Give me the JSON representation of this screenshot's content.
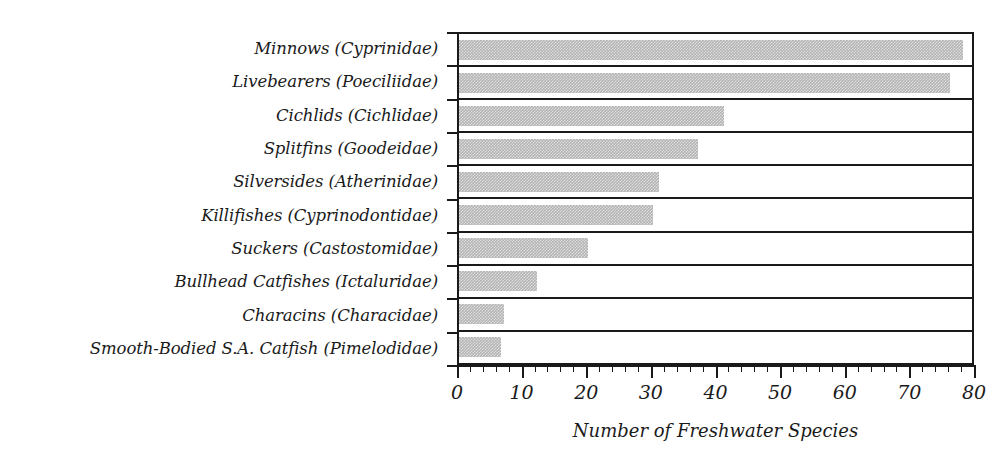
{
  "chart_data": {
    "type": "bar",
    "orientation": "horizontal",
    "title": "",
    "xlabel": "Number of Freshwater Species",
    "ylabel": "",
    "xlim": [
      0,
      80
    ],
    "ylim": null,
    "grid": false,
    "legend": null,
    "bar_color": "#b3b3b3",
    "axis_color": "#1a1a1a",
    "xticks": [
      0,
      10,
      20,
      30,
      40,
      50,
      60,
      70,
      80
    ],
    "xtick_labels": [
      "0",
      "10",
      "20",
      "30",
      "40",
      "50",
      "60",
      "70",
      "80"
    ],
    "minor_tick_step": 2,
    "categories": [
      "Minnows (Cyprinidae)",
      "Livebearers (Poeciliidae)",
      "Cichlids (Cichlidae)",
      "Splitfins (Goodeidae)",
      "Silversides (Atherinidae)",
      "Killifishes (Cyprinodontidae)",
      "Suckers (Castostomidae)",
      "Bullhead Catfishes (Ictaluridae)",
      "Characins (Characidae)",
      "Smooth-Bodied S.A. Catfish (Pimelodidae)"
    ],
    "values": [
      78,
      76,
      41,
      37,
      31,
      30,
      20,
      12,
      7,
      6.5
    ]
  }
}
